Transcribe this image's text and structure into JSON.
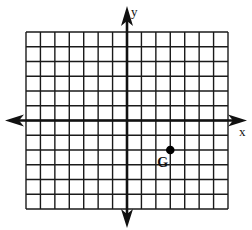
{
  "diagram": {
    "type": "coordinate-plane",
    "grid": {
      "x_min": -7,
      "x_max": 7,
      "y_min": -6,
      "y_max": 6,
      "step": 1,
      "tick_labels_shown": false
    },
    "axes": {
      "x_label": "x",
      "y_label": "y",
      "arrows": "both-ends"
    },
    "points": [
      {
        "label": "G",
        "x": 3,
        "y": -2
      }
    ],
    "colors": {
      "background": "#ffffff",
      "grid_line": "#1a1a1a",
      "axis": "#111111",
      "point": "#000000"
    }
  }
}
